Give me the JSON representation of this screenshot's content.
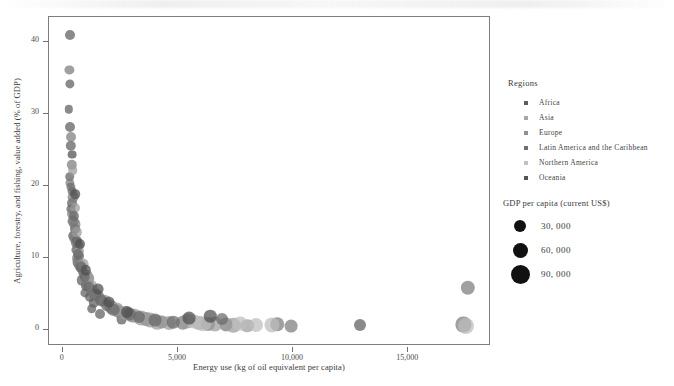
{
  "chart_data": {
    "type": "scatter",
    "title": "",
    "xlabel": "Energy use (kg of oil equivalent per capita)",
    "ylabel": "Agriculture, forestry, and fishing, value added (% of GDP)",
    "xlim": [
      -600,
      18600
    ],
    "ylim": [
      -2.2,
      43.5
    ],
    "xticks": [
      0,
      5000,
      10000,
      15000
    ],
    "xticklabels": [
      "0",
      "5,000",
      "10,000",
      "15,000"
    ],
    "yticks": [
      0,
      10,
      20,
      30,
      40
    ],
    "yticklabels": [
      "0",
      "10",
      "20",
      "30",
      "40"
    ],
    "grid": false,
    "legend_position": "right",
    "size_encoding": "GDP per capita (current US$)",
    "color_encoding": "Regions",
    "series": [
      {
        "name": "Africa",
        "color": "#5d5d5d",
        "points": [
          {
            "x": 330,
            "y": 41.0,
            "r": 5.0
          },
          {
            "x": 300,
            "y": 34.2,
            "r": 4.6
          },
          {
            "x": 250,
            "y": 30.7,
            "r": 4.2
          },
          {
            "x": 320,
            "y": 28.2,
            "r": 5.0
          },
          {
            "x": 360,
            "y": 25.6,
            "r": 5.2
          },
          {
            "x": 300,
            "y": 21.3,
            "r": 4.8
          },
          {
            "x": 390,
            "y": 19.3,
            "r": 4.4
          },
          {
            "x": 420,
            "y": 17.6,
            "r": 5.0
          },
          {
            "x": 350,
            "y": 16.8,
            "r": 4.6
          },
          {
            "x": 460,
            "y": 15.2,
            "r": 5.4
          },
          {
            "x": 520,
            "y": 14.0,
            "r": 5.0
          },
          {
            "x": 430,
            "y": 13.1,
            "r": 4.8
          },
          {
            "x": 610,
            "y": 12.4,
            "r": 5.2
          },
          {
            "x": 560,
            "y": 11.2,
            "r": 4.6
          },
          {
            "x": 700,
            "y": 10.3,
            "r": 5.0
          },
          {
            "x": 640,
            "y": 9.4,
            "r": 5.4
          },
          {
            "x": 780,
            "y": 8.6,
            "r": 5.0
          },
          {
            "x": 900,
            "y": 7.8,
            "r": 4.8
          },
          {
            "x": 820,
            "y": 6.9,
            "r": 5.2
          },
          {
            "x": 1020,
            "y": 6.1,
            "r": 5.0
          },
          {
            "x": 960,
            "y": 5.2,
            "r": 4.6
          },
          {
            "x": 1180,
            "y": 4.6,
            "r": 5.0
          },
          {
            "x": 1350,
            "y": 3.8,
            "r": 5.2
          },
          {
            "x": 1250,
            "y": 3.0,
            "r": 4.8
          },
          {
            "x": 1600,
            "y": 2.3,
            "r": 5.0
          },
          {
            "x": 2550,
            "y": 1.5,
            "r": 5.4
          },
          {
            "x": 12900,
            "y": 0.7,
            "r": 6.0
          }
        ]
      },
      {
        "name": "Asia",
        "color": "#7c7c7c",
        "points": [
          {
            "x": 290,
            "y": 36.1,
            "r": 4.6
          },
          {
            "x": 340,
            "y": 26.9,
            "r": 5.0
          },
          {
            "x": 380,
            "y": 23.0,
            "r": 5.2
          },
          {
            "x": 300,
            "y": 20.4,
            "r": 4.6
          },
          {
            "x": 450,
            "y": 18.5,
            "r": 5.4
          },
          {
            "x": 400,
            "y": 16.1,
            "r": 5.0
          },
          {
            "x": 540,
            "y": 14.7,
            "r": 5.6
          },
          {
            "x": 490,
            "y": 12.8,
            "r": 5.0
          },
          {
            "x": 660,
            "y": 11.7,
            "r": 5.4
          },
          {
            "x": 600,
            "y": 10.0,
            "r": 5.0
          },
          {
            "x": 760,
            "y": 9.0,
            "r": 5.6
          },
          {
            "x": 860,
            "y": 8.1,
            "r": 5.2
          },
          {
            "x": 1100,
            "y": 7.2,
            "r": 5.8
          },
          {
            "x": 990,
            "y": 6.4,
            "r": 5.0
          },
          {
            "x": 1300,
            "y": 5.5,
            "r": 5.6
          },
          {
            "x": 1520,
            "y": 4.8,
            "r": 6.0
          },
          {
            "x": 1700,
            "y": 4.0,
            "r": 5.4
          },
          {
            "x": 2100,
            "y": 3.2,
            "r": 6.2
          },
          {
            "x": 2400,
            "y": 2.6,
            "r": 6.4
          },
          {
            "x": 3000,
            "y": 2.0,
            "r": 6.8
          },
          {
            "x": 3600,
            "y": 1.6,
            "r": 7.0
          },
          {
            "x": 4300,
            "y": 1.2,
            "r": 6.6
          },
          {
            "x": 5200,
            "y": 1.0,
            "r": 7.2
          },
          {
            "x": 6300,
            "y": 0.9,
            "r": 7.0
          },
          {
            "x": 7100,
            "y": 0.8,
            "r": 6.6
          },
          {
            "x": 9300,
            "y": 0.8,
            "r": 6.8
          },
          {
            "x": 9900,
            "y": 0.6,
            "r": 6.4
          },
          {
            "x": 17600,
            "y": 5.9,
            "r": 7.2
          },
          {
            "x": 17400,
            "y": 0.8,
            "r": 7.6
          }
        ]
      },
      {
        "name": "Europe",
        "color": "#9b9b9b",
        "points": [
          {
            "x": 430,
            "y": 22.2,
            "r": 4.8
          },
          {
            "x": 520,
            "y": 17.0,
            "r": 5.0
          },
          {
            "x": 620,
            "y": 13.6,
            "r": 5.2
          },
          {
            "x": 700,
            "y": 11.0,
            "r": 5.0
          },
          {
            "x": 880,
            "y": 9.2,
            "r": 5.4
          },
          {
            "x": 1050,
            "y": 7.6,
            "r": 5.6
          },
          {
            "x": 1250,
            "y": 6.2,
            "r": 5.8
          },
          {
            "x": 1450,
            "y": 5.0,
            "r": 6.0
          },
          {
            "x": 1800,
            "y": 4.1,
            "r": 6.2
          },
          {
            "x": 2050,
            "y": 3.4,
            "r": 6.4
          },
          {
            "x": 2350,
            "y": 2.9,
            "r": 6.6
          },
          {
            "x": 2700,
            "y": 2.4,
            "r": 7.0
          },
          {
            "x": 3100,
            "y": 2.0,
            "r": 7.2
          },
          {
            "x": 3400,
            "y": 1.7,
            "r": 7.4
          },
          {
            "x": 3800,
            "y": 1.4,
            "r": 7.6
          },
          {
            "x": 4100,
            "y": 1.1,
            "r": 7.2
          },
          {
            "x": 4600,
            "y": 1.0,
            "r": 7.0
          },
          {
            "x": 5400,
            "y": 1.3,
            "r": 7.4
          },
          {
            "x": 5900,
            "y": 1.0,
            "r": 7.0
          },
          {
            "x": 6600,
            "y": 0.9,
            "r": 7.6
          },
          {
            "x": 7400,
            "y": 0.7,
            "r": 7.2
          },
          {
            "x": 8000,
            "y": 0.6,
            "r": 6.8
          }
        ]
      },
      {
        "name": "Latin America and the Caribbean",
        "color": "#6a6a6a",
        "points": [
          {
            "x": 360,
            "y": 19.9,
            "r": 4.6
          },
          {
            "x": 480,
            "y": 15.8,
            "r": 5.0
          },
          {
            "x": 580,
            "y": 12.2,
            "r": 5.2
          },
          {
            "x": 680,
            "y": 10.6,
            "r": 5.0
          },
          {
            "x": 800,
            "y": 8.8,
            "r": 5.4
          },
          {
            "x": 950,
            "y": 7.4,
            "r": 5.2
          },
          {
            "x": 1150,
            "y": 6.0,
            "r": 5.6
          },
          {
            "x": 1400,
            "y": 4.9,
            "r": 5.8
          },
          {
            "x": 1650,
            "y": 4.2,
            "r": 6.0
          },
          {
            "x": 1900,
            "y": 3.5,
            "r": 5.8
          },
          {
            "x": 2200,
            "y": 2.8,
            "r": 6.2
          },
          {
            "x": 2900,
            "y": 2.2,
            "r": 6.4
          },
          {
            "x": 3300,
            "y": 1.8,
            "r": 6.0
          },
          {
            "x": 4000,
            "y": 1.4,
            "r": 6.4
          },
          {
            "x": 4800,
            "y": 1.1,
            "r": 6.2
          },
          {
            "x": 6900,
            "y": 1.5,
            "r": 6.0
          }
        ]
      },
      {
        "name": "Northern America",
        "color": "#bdbdbd",
        "points": [
          {
            "x": 5700,
            "y": 1.2,
            "r": 7.4
          },
          {
            "x": 6100,
            "y": 0.9,
            "r": 7.8
          },
          {
            "x": 7700,
            "y": 0.9,
            "r": 7.4
          },
          {
            "x": 8400,
            "y": 0.7,
            "r": 7.0
          },
          {
            "x": 9100,
            "y": 0.7,
            "r": 7.6
          },
          {
            "x": 17500,
            "y": 0.6,
            "r": 8.0
          }
        ]
      },
      {
        "name": "Oceania",
        "color": "#4e4e4e",
        "points": [
          {
            "x": 410,
            "y": 24.4,
            "r": 4.4
          },
          {
            "x": 540,
            "y": 18.9,
            "r": 4.8
          },
          {
            "x": 730,
            "y": 12.0,
            "r": 5.0
          },
          {
            "x": 1000,
            "y": 8.3,
            "r": 5.2
          },
          {
            "x": 1550,
            "y": 5.7,
            "r": 5.4
          },
          {
            "x": 2000,
            "y": 3.9,
            "r": 5.6
          },
          {
            "x": 2800,
            "y": 2.5,
            "r": 6.0
          },
          {
            "x": 5500,
            "y": 1.7,
            "r": 6.4
          },
          {
            "x": 6400,
            "y": 1.9,
            "r": 6.2
          }
        ]
      }
    ]
  },
  "region_legend": {
    "title": "Regions",
    "items": [
      {
        "label": "Africa",
        "color": "#5d5d5d"
      },
      {
        "label": "Asia",
        "color": "#a6a6a6"
      },
      {
        "label": "Europe",
        "color": "#8f8f8f"
      },
      {
        "label": "Latin America and the Caribbean",
        "color": "#6f6f6f"
      },
      {
        "label": "Northern America",
        "color": "#c2c2c2"
      },
      {
        "label": "Oceania",
        "color": "#555555"
      }
    ]
  },
  "size_legend": {
    "title": "GDP per capita (current US$)",
    "items": [
      {
        "label": "30, 000",
        "diameter": 12
      },
      {
        "label": "60, 000",
        "diameter": 15
      },
      {
        "label": "90, 000",
        "diameter": 19
      }
    ]
  }
}
